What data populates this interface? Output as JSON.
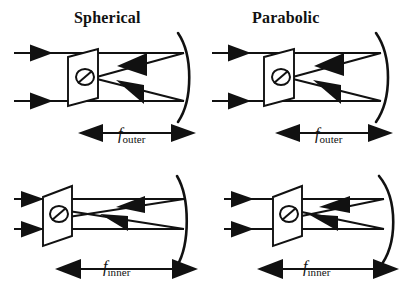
{
  "figure": {
    "caption_type": "optics-ray-diagram",
    "panels": [
      {
        "id": "top-left",
        "title": "Spherical",
        "mirror_type": "spherical",
        "focus_label_base": "f",
        "focus_label_sub": "outer",
        "ray_count": 2,
        "detector_position": "mid",
        "mirror_shape": "circular-arc"
      },
      {
        "id": "top-right",
        "title": "Parabolic",
        "mirror_type": "parabolic",
        "focus_label_base": "f",
        "focus_label_sub": "outer",
        "ray_count": 2,
        "detector_position": "mid",
        "mirror_shape": "parabolic-arc"
      },
      {
        "id": "bottom-left",
        "title": "",
        "mirror_type": "spherical",
        "focus_label_base": "f",
        "focus_label_sub": "inner",
        "ray_count": 2,
        "detector_position": "far-left",
        "mirror_shape": "circular-arc"
      },
      {
        "id": "bottom-right",
        "title": "",
        "mirror_type": "parabolic",
        "focus_label_base": "f",
        "focus_label_sub": "inner",
        "ray_count": 2,
        "detector_position": "left",
        "mirror_shape": "parabolic-arc"
      }
    ],
    "titles": {
      "spherical": "Spherical",
      "parabolic": "Parabolic"
    },
    "focal_labels": {
      "outer_base": "f",
      "outer_sub": "outer",
      "inner_base": "f",
      "inner_sub": "inner"
    },
    "colors": {
      "ink": "#111111",
      "background": "#ffffff"
    }
  }
}
